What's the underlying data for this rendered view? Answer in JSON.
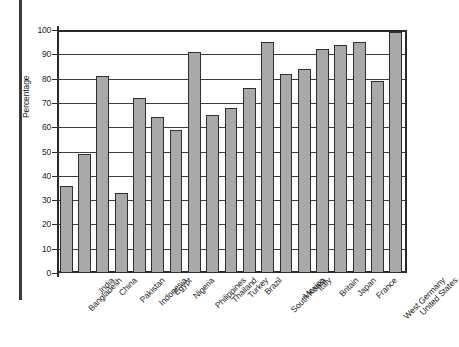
{
  "chart_data": {
    "type": "bar",
    "title": "",
    "subtitle": "",
    "xlabel": "",
    "ylabel": "Percentage",
    "ylim": [
      0,
      100
    ],
    "ytick_step": 10,
    "yticks": [
      0,
      10,
      20,
      30,
      40,
      50,
      60,
      70,
      80,
      90,
      100
    ],
    "ytick_labels": [
      "0",
      "10",
      "20",
      "30",
      "40",
      "50",
      "60",
      "70",
      "80",
      "90",
      "100"
    ],
    "grid": true,
    "grid_axis": "y",
    "legend": false,
    "legend_position": "none",
    "bar_fill_color": "#a9a9a9",
    "bar_edge_color": "#2f2f2f",
    "categories": [
      "Bangladesh",
      "India",
      "China",
      "Pakistan",
      "Indonesia",
      "Egypt",
      "Nigeria",
      "Philippines",
      "Thailand",
      "Turkey",
      "Brazil",
      "South Korea",
      "Mexico",
      "Italy",
      "Britain",
      "Japan",
      "France",
      "West Germany",
      "United States"
    ],
    "values": [
      36,
      49,
      81,
      33,
      72,
      64,
      59,
      91,
      65,
      68,
      76,
      95,
      82,
      84,
      92,
      94,
      95,
      79,
      99
    ]
  },
  "figure": {
    "background_color": "#ffffff",
    "axis_color": "#2a2a2a",
    "text_color": "#1b1b1b"
  }
}
